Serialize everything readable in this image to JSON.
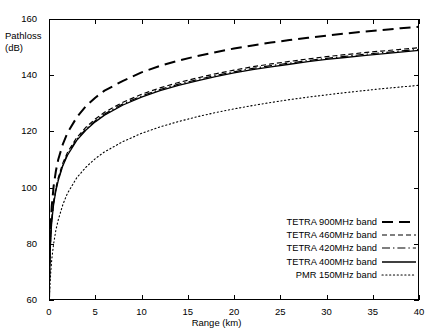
{
  "chart_data": {
    "type": "line",
    "title": "",
    "xlabel": "Range (km)",
    "ylabel": "Pathloss (dB)",
    "ylabel_line1": "Pathloss",
    "ylabel_line2": "(dB)",
    "xlim": [
      0,
      40
    ],
    "ylim": [
      60,
      160
    ],
    "xticks": [
      0,
      5,
      10,
      15,
      20,
      25,
      30,
      35,
      40
    ],
    "yticks": [
      60,
      80,
      100,
      120,
      140,
      160
    ],
    "grid": false,
    "legend_position": "lower right",
    "x": [
      0.01,
      0.05,
      0.1,
      0.2,
      0.3,
      0.5,
      0.75,
      1,
      1.5,
      2,
      3,
      4,
      5,
      6,
      8,
      10,
      12,
      14,
      16,
      18,
      20,
      22,
      24,
      26,
      28,
      30,
      32,
      34,
      36,
      38,
      40
    ],
    "series": [
      {
        "name": "TETRA 900MHz band",
        "style": "long-dash",
        "width": 2.0,
        "color": "#000000",
        "values": [
          61.0,
          70.5,
          79.0,
          88.0,
          93.5,
          100.5,
          106.0,
          110.0,
          115.5,
          119.5,
          125.0,
          129.0,
          132.0,
          134.5,
          138.0,
          141.0,
          143.3,
          145.2,
          146.8,
          148.2,
          149.5,
          150.6,
          151.6,
          152.5,
          153.3,
          154.1,
          154.8,
          155.5,
          156.1,
          156.7,
          157.2
        ]
      },
      {
        "name": "TETRA 460MHz band",
        "style": "short-dash",
        "width": 1.2,
        "color": "#000000",
        "values": [
          60.5,
          68.5,
          76.0,
          84.0,
          88.8,
          95.0,
          100.0,
          103.5,
          108.8,
          112.5,
          117.8,
          121.5,
          124.4,
          126.8,
          130.4,
          133.2,
          135.5,
          137.4,
          139.0,
          140.5,
          141.8,
          143.0,
          144.0,
          144.9,
          145.8,
          146.6,
          147.3,
          148.0,
          148.6,
          149.2,
          149.8
        ]
      },
      {
        "name": "TETRA 420MHz band",
        "style": "dash-dot",
        "width": 1.2,
        "color": "#000000",
        "values": [
          60.4,
          68.2,
          75.6,
          83.5,
          88.3,
          94.5,
          99.4,
          102.9,
          108.2,
          111.9,
          117.2,
          120.9,
          123.8,
          126.2,
          129.8,
          132.6,
          134.9,
          136.8,
          138.4,
          139.9,
          141.2,
          142.4,
          143.4,
          144.3,
          145.2,
          146.0,
          146.7,
          147.4,
          148.0,
          148.6,
          149.2
        ]
      },
      {
        "name": "TETRA 400MHz band",
        "style": "solid",
        "width": 1.3,
        "color": "#000000",
        "values": [
          60.3,
          68.0,
          75.3,
          83.2,
          88.0,
          94.1,
          99.0,
          102.5,
          107.8,
          111.5,
          116.8,
          120.5,
          123.4,
          125.8,
          129.4,
          132.2,
          134.5,
          136.4,
          138.0,
          139.5,
          140.8,
          142.0,
          143.0,
          143.9,
          144.8,
          145.6,
          146.3,
          147.0,
          147.6,
          148.2,
          148.8
        ]
      },
      {
        "name": "PMR 150MHz band",
        "style": "dotted",
        "width": 1.1,
        "color": "#000000",
        "values": [
          60.1,
          62.0,
          65.0,
          70.5,
          74.5,
          80.0,
          85.0,
          88.5,
          94.0,
          98.0,
          103.5,
          107.3,
          110.3,
          112.7,
          116.4,
          119.3,
          121.6,
          123.5,
          125.2,
          126.7,
          128.0,
          129.2,
          130.3,
          131.3,
          132.2,
          133.0,
          133.8,
          134.5,
          135.2,
          135.8,
          136.4
        ]
      }
    ]
  }
}
